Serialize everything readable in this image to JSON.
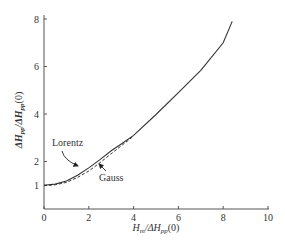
{
  "chart_data": {
    "type": "line",
    "title": "",
    "xlabel": "H_m/ΔH_pp(0)",
    "ylabel": "ΔH_pp/ΔH_pp(0)",
    "xlim": [
      0,
      10
    ],
    "ylim": [
      0,
      8
    ],
    "xticks": [
      0,
      2,
      4,
      6,
      8,
      10
    ],
    "yticks": [
      1,
      2,
      4,
      6,
      8
    ],
    "grid": false,
    "legend": "inline annotations with arrows",
    "series": [
      {
        "name": "Lorentz",
        "style": "solid",
        "x": [
          0,
          0.5,
          1,
          1.5,
          2,
          2.5,
          3,
          3.5,
          4,
          5,
          6,
          7,
          8,
          8.4
        ],
        "y": [
          1.0,
          1.05,
          1.18,
          1.42,
          1.73,
          2.08,
          2.45,
          2.77,
          3.1,
          3.98,
          4.9,
          5.84,
          7.0,
          7.9
        ]
      },
      {
        "name": "Gauss",
        "style": "dashed",
        "x": [
          0,
          0.5,
          1,
          1.5,
          2,
          2.5,
          3,
          3.5,
          4
        ],
        "y": [
          0.98,
          1.02,
          1.12,
          1.33,
          1.6,
          1.95,
          2.33,
          2.7,
          3.07
        ]
      }
    ],
    "annotations": [
      {
        "text": "Lorentz",
        "target_series": "Lorentz"
      },
      {
        "text": "Gauss",
        "target_series": "Gauss"
      }
    ]
  },
  "axes": {
    "x_tick_labels": [
      "0",
      "2",
      "4",
      "6",
      "8",
      "10"
    ],
    "y_tick_labels": [
      "1",
      "2",
      "4",
      "6",
      "8"
    ]
  },
  "labels": {
    "lorentz": "Lorentz",
    "gauss": "Gauss"
  }
}
